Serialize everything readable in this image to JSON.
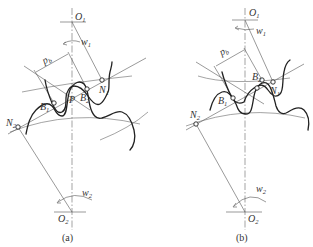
{
  "figure": {
    "type": "gear-meshing-diagram",
    "panels": [
      {
        "id": "a",
        "caption": "(a)",
        "labels": {
          "o1": "O",
          "o1_sub": "1",
          "o2": "O",
          "o2_sub": "2",
          "w1": "w",
          "w1_sub": "1",
          "w2": "w",
          "w2_sub": "2",
          "pb": "p",
          "pb_sub": "b",
          "n1": "N",
          "n1_sub": "1",
          "n2": "N",
          "n2_sub": "2",
          "b1": "B",
          "b1_sub": "1",
          "b2": "B",
          "b2_sub": "2",
          "p": "P"
        }
      },
      {
        "id": "b",
        "caption": "(b)",
        "labels": {
          "o1": "O",
          "o1_sub": "1",
          "o2": "O",
          "o2_sub": "2",
          "w1": "w",
          "w1_sub": "1",
          "w2": "w",
          "w2_sub": "2",
          "pb": "p",
          "pb_sub": "b",
          "n1": "N",
          "n1_sub": "1",
          "n2": "N",
          "n2_sub": "2",
          "b1": "B",
          "b1_sub": "1",
          "b2": "B",
          "b2_sub": "2"
        }
      }
    ]
  },
  "colors": {
    "line": "#555555",
    "profile": "#222222",
    "background": "#ffffff"
  }
}
